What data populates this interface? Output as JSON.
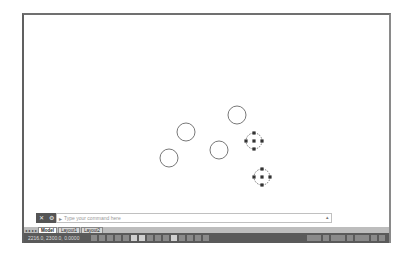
{
  "canvas": {
    "circles": [
      {
        "cx": 162,
        "cy": 117,
        "r": 9,
        "selected": false
      },
      {
        "cx": 213,
        "cy": 100,
        "r": 9,
        "selected": false
      },
      {
        "cx": 195,
        "cy": 135,
        "r": 9,
        "selected": false
      },
      {
        "cx": 145,
        "cy": 143,
        "r": 9,
        "selected": false
      },
      {
        "cx": 230,
        "cy": 126,
        "r": 8,
        "selected": true
      },
      {
        "cx": 238,
        "cy": 162,
        "r": 8,
        "selected": true
      }
    ],
    "stroke_color": "#555555",
    "grip_color": "#333333"
  },
  "command_line": {
    "close_icon": "close-icon",
    "settings_icon": "wrench-icon",
    "prompt_icon": "prompt-icon",
    "placeholder": "Type your command here"
  },
  "tabs": [
    {
      "label": "Model",
      "active": true
    },
    {
      "label": "Layout1",
      "active": false
    },
    {
      "label": "Layout2",
      "active": false
    }
  ],
  "status_bar": {
    "coordinates": "2216.0, 2300.0, 0.0000"
  }
}
